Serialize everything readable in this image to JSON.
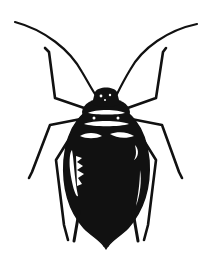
{
  "image": {
    "subject": "aphid",
    "style": "black-and-white ink illustration",
    "view": "dorsal",
    "background_color": "#ffffff",
    "ink_color": "#111111",
    "highlight_color": "#ffffff"
  },
  "parts": {
    "antennae": 2,
    "legs": 6,
    "siphunculi": 2,
    "has_cauda": true
  }
}
